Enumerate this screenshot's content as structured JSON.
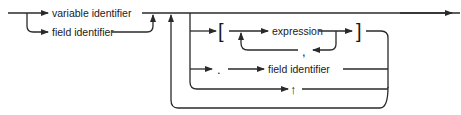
{
  "diagram": {
    "type": "syntax-diagram",
    "title": "",
    "nodes": {
      "variable_identifier": "variable identifier",
      "field_identifier_1": "field identifier",
      "left_bracket": "[",
      "expression": "expression",
      "right_bracket": "]",
      "comma": ",",
      "period": ".",
      "field_identifier_2": "field identifier",
      "up_arrow": "↑"
    },
    "colors": {
      "line": "#2a2a2a",
      "text": "#1a1a1a",
      "background": "#ffffff"
    }
  }
}
